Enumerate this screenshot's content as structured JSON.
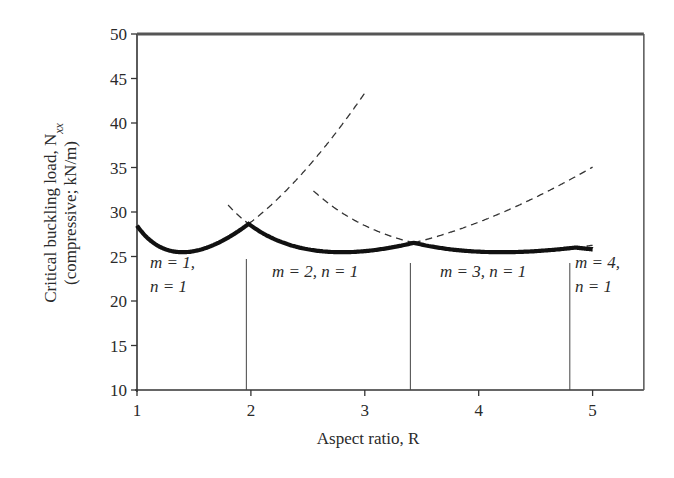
{
  "chart_data": {
    "type": "line",
    "title": "",
    "xlabel": "Aspect ratio, R",
    "ylabel_line1": "Critical buckling load, N",
    "ylabel_subscript": "xx",
    "ylabel_line2": "(compressive; kN/m)",
    "xlim": [
      1,
      5.45
    ],
    "ylim": [
      10,
      50
    ],
    "x_ticks": [
      1,
      2,
      3,
      4,
      5
    ],
    "y_ticks": [
      10,
      15,
      20,
      25,
      30,
      35,
      40,
      45,
      50
    ],
    "grid": false,
    "legend": null,
    "series": [
      {
        "name": "m = 1, n = 1",
        "style": "dashed",
        "x": [
          1.0,
          1.4,
          1.98,
          2.6,
          2.9
        ],
        "y": [
          28.5,
          25.5,
          30.0,
          38.0,
          50.0
        ]
      },
      {
        "name": "m = 2, n = 1",
        "style": "dashed",
        "x": [
          1.9,
          1.98,
          2.8,
          3.43,
          4.0,
          5.0
        ],
        "y": [
          50.0,
          30.0,
          25.5,
          27.0,
          30.5,
          39.5
        ]
      },
      {
        "name": "m = 3, n = 1",
        "style": "dashed",
        "x": [
          2.6,
          3.0,
          3.43,
          4.2,
          4.85,
          5.0
        ],
        "y": [
          50.0,
          37.0,
          27.0,
          25.5,
          26.5,
          26.9
        ]
      },
      {
        "name": "envelope (critical)",
        "style": "solid-bold",
        "x": [
          1.0,
          1.4,
          1.98,
          2.8,
          3.43,
          4.2,
          4.85,
          5.0
        ],
        "y": [
          28.5,
          25.5,
          30.0,
          25.5,
          27.0,
          25.5,
          26.5,
          26.0
        ]
      }
    ],
    "mode_boundaries_R": [
      1.96,
      3.4,
      4.8
    ],
    "annotations": [
      {
        "text_line1": "m = 1,",
        "text_line2": "n = 1",
        "region": [
          1.0,
          1.96
        ]
      },
      {
        "text_line1": "m = 2, n = 1",
        "text_line2": "",
        "region": [
          1.96,
          3.4
        ]
      },
      {
        "text_line1": "m = 3, n = 1",
        "text_line2": "",
        "region": [
          3.4,
          4.8
        ]
      },
      {
        "text_line1": "m = 4,",
        "text_line2": "n = 1",
        "region": [
          4.8,
          5.45
        ]
      }
    ],
    "model": {
      "k": 6.37,
      "r0": 1.4,
      "formula": "N = k*(r0*m/R + R/(r0*m))^2"
    }
  },
  "labels": {
    "x_axis_title": "Aspect ratio, R",
    "y_axis_title_1": "Critical buckling load, N",
    "y_axis_title_sub": "xx",
    "y_axis_title_2": "(compressive; kN/m)",
    "region_1_a": "m = 1,",
    "region_1_b": "n = 1",
    "region_2": "m = 2, n = 1",
    "region_3": "m = 3, n = 1",
    "region_4_a": "m = 4,",
    "region_4_b": "n = 1"
  },
  "colors": {
    "line": "#111111",
    "dashed": "#333333",
    "axis": "#333333"
  }
}
